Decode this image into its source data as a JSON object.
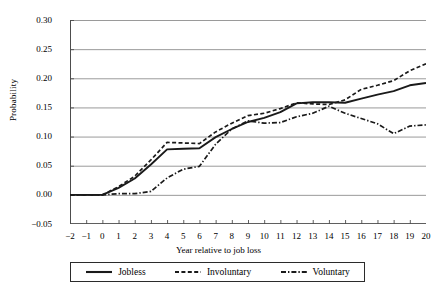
{
  "axes": {
    "ylabel": "Probability",
    "xlabel": "Year relative to job loss",
    "yticks": [
      "0.30",
      "0.25",
      "0.20",
      "0.15",
      "0.10",
      "0.05",
      "0.00",
      "-0.05"
    ],
    "xticks": [
      "-2",
      "-1",
      "0",
      "1",
      "2",
      "3",
      "4",
      "5",
      "6",
      "7",
      "8",
      "9",
      "10",
      "11",
      "12",
      "13",
      "14",
      "15",
      "16",
      "17",
      "18",
      "19",
      "20"
    ]
  },
  "legend": {
    "items": [
      {
        "label": "Jobless",
        "style": "solid",
        "color": "#1a1a1a"
      },
      {
        "label": "Involuntary",
        "style": "dashed",
        "color": "#1a1a1a"
      },
      {
        "label": "Voluntary",
        "style": "dash-dot",
        "color": "#1a1a1a"
      }
    ]
  },
  "chart_data": {
    "type": "line",
    "title": "",
    "xlabel": "Year relative to job loss",
    "ylabel": "Probability",
    "xlim": [
      -2,
      20
    ],
    "ylim": [
      -0.05,
      0.3
    ],
    "ytick_step": 0.05,
    "grid": "horizontal",
    "legend_position": "bottom",
    "x": [
      -2,
      -1,
      0,
      1,
      2,
      3,
      4,
      5,
      6,
      7,
      8,
      9,
      10,
      11,
      12,
      13,
      14,
      15,
      16,
      17,
      18,
      19,
      20
    ],
    "series": [
      {
        "name": "Jobless",
        "style": "solid",
        "color": "#1a1a1a",
        "values": [
          0.0,
          0.0,
          0.0,
          0.012,
          0.028,
          0.052,
          0.078,
          0.079,
          0.08,
          0.099,
          0.113,
          0.125,
          0.132,
          0.142,
          0.157,
          0.159,
          0.159,
          0.158,
          0.165,
          0.172,
          0.178,
          0.188,
          0.192
        ]
      },
      {
        "name": "Involuntary",
        "style": "dashed",
        "color": "#1a1a1a",
        "values": [
          0.0,
          0.0,
          0.0,
          0.014,
          0.032,
          0.06,
          0.09,
          0.089,
          0.088,
          0.108,
          0.123,
          0.136,
          0.14,
          0.148,
          0.158,
          0.156,
          0.155,
          0.163,
          0.181,
          0.188,
          0.196,
          0.213,
          0.225
        ]
      },
      {
        "name": "Voluntary",
        "style": "dash-dot",
        "color": "#1a1a1a",
        "values": [
          0.0,
          0.0,
          0.0,
          0.002,
          0.002,
          0.006,
          0.029,
          0.044,
          0.049,
          0.087,
          0.113,
          0.127,
          0.123,
          0.124,
          0.134,
          0.14,
          0.152,
          0.14,
          0.131,
          0.122,
          0.105,
          0.118,
          0.12
        ]
      }
    ]
  }
}
